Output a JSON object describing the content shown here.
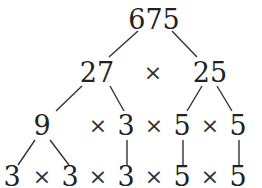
{
  "diagram": {
    "type": "factor-tree",
    "root": "675",
    "level1": {
      "left": "27",
      "op": "×",
      "right": "25"
    },
    "level2": [
      "9",
      "×",
      "3",
      "×",
      "5",
      "×",
      "5"
    ],
    "level3": [
      "3",
      "×",
      "3",
      "×",
      "3",
      "×",
      "5",
      "×",
      "5"
    ]
  }
}
